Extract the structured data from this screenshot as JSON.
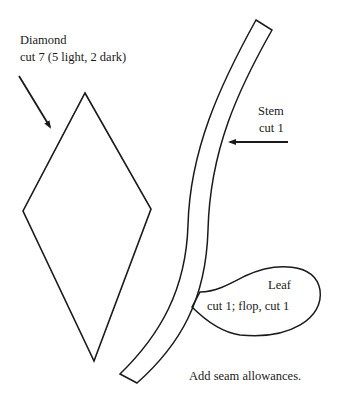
{
  "pieces": {
    "diamond": {
      "name": "Diamond",
      "instruction": "cut 7 (5 light, 2 dark)"
    },
    "stem": {
      "name": "Stem",
      "instruction": "cut 1"
    },
    "leaf": {
      "name": "Leaf",
      "instruction": "cut 1; flop, cut 1"
    }
  },
  "note": "Add seam allowances."
}
